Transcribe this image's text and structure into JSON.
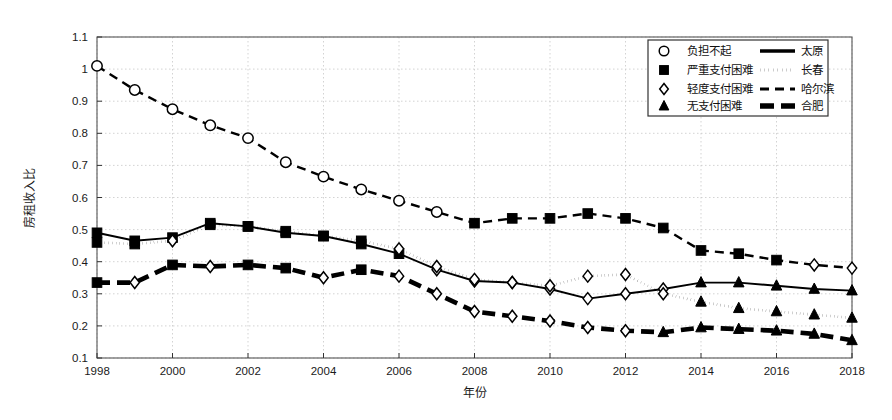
{
  "chart_data": {
    "type": "line",
    "title": "",
    "xlabel": "年份",
    "ylabel": "房租收入比",
    "xlim": [
      1998,
      2018
    ],
    "ylim": [
      0.1,
      1.1
    ],
    "grid": true,
    "legend_position": "top-right",
    "x": [
      1998,
      1999,
      2000,
      2001,
      2002,
      2003,
      2004,
      2005,
      2006,
      2007,
      2008,
      2009,
      2010,
      2011,
      2012,
      2013,
      2014,
      2015,
      2016,
      2017,
      2018
    ],
    "xticks": [
      1998,
      2000,
      2002,
      2004,
      2006,
      2008,
      2010,
      2012,
      2014,
      2016,
      2018
    ],
    "xtick_labels": [
      "1998",
      "2000",
      "2002",
      "2004",
      "2006",
      "2008",
      "2010",
      "2012",
      "2014",
      "2016",
      "2018"
    ],
    "yticks": [
      0.1,
      0.2,
      0.3,
      0.4,
      0.5,
      0.6,
      0.7,
      0.8,
      0.9,
      1.0,
      1.1
    ],
    "ytick_labels": [
      "0.1",
      "0.2",
      "0.3",
      "0.4",
      "0.5",
      "0.6",
      "0.7",
      "0.8",
      "0.9",
      "1",
      "1.1"
    ],
    "series": [
      {
        "name": "哈尔滨",
        "line_style": "dashed",
        "values": [
          1.01,
          0.935,
          0.875,
          0.825,
          0.785,
          0.71,
          0.665,
          0.625,
          0.59,
          0.555,
          0.52,
          0.535,
          0.535,
          0.55,
          0.535,
          0.505,
          0.435,
          0.425,
          0.405,
          0.39,
          0.38
        ],
        "markers": [
          "circle",
          "circle",
          "circle",
          "circle",
          "circle",
          "circle",
          "circle",
          "circle",
          "circle",
          "circle",
          "square",
          "square",
          "square",
          "square",
          "square",
          "square",
          "square",
          "square",
          "square",
          "diamond",
          "diamond"
        ]
      },
      {
        "name": "太原",
        "line_style": "solid",
        "values": [
          0.49,
          0.465,
          0.475,
          0.52,
          0.51,
          0.49,
          0.48,
          0.455,
          0.425,
          0.375,
          0.34,
          0.335,
          0.315,
          0.285,
          0.3,
          0.315,
          0.335,
          0.335,
          0.325,
          0.315,
          0.31
        ],
        "markers": [
          "square",
          "square",
          "square",
          "square",
          "square",
          "square",
          "square",
          "square",
          "square",
          "diamond",
          "diamond",
          "diamond",
          "diamond",
          "diamond",
          "diamond",
          "diamond",
          "triangle",
          "triangle",
          "triangle",
          "triangle",
          "triangle"
        ]
      },
      {
        "name": "长春",
        "line_style": "dotted",
        "values": [
          0.46,
          0.455,
          0.465,
          0.515,
          0.51,
          0.495,
          0.48,
          0.465,
          0.44,
          0.385,
          0.345,
          0.335,
          0.325,
          0.355,
          0.36,
          0.3,
          0.275,
          0.255,
          0.245,
          0.235,
          0.225
        ],
        "markers": [
          "square",
          "square",
          "diamond",
          "square",
          "square",
          "square",
          "square",
          "square",
          "diamond",
          "diamond",
          "diamond",
          "diamond",
          "diamond",
          "diamond",
          "diamond",
          "diamond",
          "triangle",
          "triangle",
          "triangle",
          "triangle",
          "triangle"
        ]
      },
      {
        "name": "合肥",
        "line_style": "thick-dashed",
        "values": [
          0.335,
          0.335,
          0.39,
          0.385,
          0.39,
          0.38,
          0.35,
          0.375,
          0.355,
          0.3,
          0.245,
          0.23,
          0.215,
          0.195,
          0.185,
          0.18,
          0.195,
          0.19,
          0.185,
          0.175,
          0.155
        ],
        "markers": [
          "square",
          "diamond",
          "square",
          "diamond",
          "square",
          "square",
          "diamond",
          "square",
          "diamond",
          "diamond",
          "diamond",
          "diamond",
          "diamond",
          "diamond",
          "diamond",
          "triangle",
          "triangle",
          "triangle",
          "triangle",
          "triangle",
          "triangle"
        ]
      }
    ],
    "marker_legend": [
      {
        "marker": "circle",
        "label": "负担不起"
      },
      {
        "marker": "square",
        "label": "严重支付困难"
      },
      {
        "marker": "diamond",
        "label": "轻度支付困难"
      },
      {
        "marker": "triangle",
        "label": "无支付困难"
      }
    ],
    "line_legend": [
      {
        "style": "solid",
        "label": "太原"
      },
      {
        "style": "dotted",
        "label": "长春"
      },
      {
        "style": "dashed",
        "label": "哈尔滨"
      },
      {
        "style": "thick-dashed",
        "label": "合肥"
      }
    ],
    "colors": {
      "line": "#000000",
      "grid": "#c8c8c8",
      "axis": "#555555",
      "background": "#ffffff"
    }
  }
}
